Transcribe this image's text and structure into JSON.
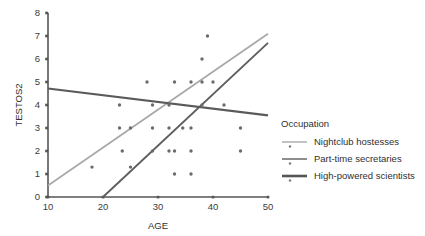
{
  "chart_data": {
    "type": "scatter",
    "title": "",
    "xlabel": "AGE",
    "ylabel": "TESTOS2",
    "xlim": [
      10,
      50
    ],
    "ylim": [
      0,
      8
    ],
    "xticks": [
      10,
      20,
      30,
      40,
      50
    ],
    "yticks": [
      0,
      1,
      2,
      3,
      4,
      5,
      6,
      7,
      8
    ],
    "grid": false,
    "legend_position": "right",
    "legend_title": "Occupation",
    "series": [
      {
        "name": "Nightclub hostesses",
        "color": "#a8a8a8",
        "marker": "dot",
        "trendline": {
          "x": [
            10,
            50
          ],
          "y": [
            0.5,
            7.1
          ]
        },
        "points": [
          {
            "x": 18,
            "y": 1.3
          },
          {
            "x": 23,
            "y": 3
          },
          {
            "x": 23,
            "y": 4
          },
          {
            "x": 25,
            "y": 2
          },
          {
            "x": 25,
            "y": 1.3
          },
          {
            "x": 28,
            "y": 5
          },
          {
            "x": 29,
            "y": 3
          },
          {
            "x": 32,
            "y": 3
          },
          {
            "x": 33,
            "y": 5
          },
          {
            "x": 36,
            "y": 5
          },
          {
            "x": 38,
            "y": 5
          },
          {
            "x": 39,
            "y": 7
          },
          {
            "x": 40,
            "y": 5
          }
        ]
      },
      {
        "name": "Part-time secretaries",
        "color": "#8e8e8e",
        "marker": "dot",
        "trendline": {
          "x": [
            10,
            50
          ],
          "y": [
            0.5,
            6.7
          ]
        },
        "points": [
          {
            "x": 29,
            "y": 2
          },
          {
            "x": 29,
            "y": 4
          },
          {
            "x": 32,
            "y": 2
          },
          {
            "x": 33,
            "y": 2
          },
          {
            "x": 33,
            "y": 1
          },
          {
            "x": 36,
            "y": 2
          },
          {
            "x": 36,
            "y": 3
          },
          {
            "x": 36,
            "y": 1
          },
          {
            "x": 38,
            "y": 5
          },
          {
            "x": 38,
            "y": 6
          }
        ]
      },
      {
        "name": "High-powered scientists",
        "color": "#5a5a5a",
        "marker": "dot",
        "trendline": {
          "x": [
            10,
            50
          ],
          "y": [
            4.72,
            3.55
          ]
        },
        "points": [
          {
            "x": 32,
            "y": 3
          },
          {
            "x": 42,
            "y": 4
          },
          {
            "x": 45,
            "y": 3
          },
          {
            "x": 45,
            "y": 2
          }
        ]
      }
    ],
    "steep_line": {
      "x": [
        20,
        50
      ],
      "y": [
        0,
        6.7
      ],
      "color": "#5e5e5e"
    },
    "all_points": [
      {
        "x": 18,
        "y": 1.3
      },
      {
        "x": 23,
        "y": 3
      },
      {
        "x": 23,
        "y": 4
      },
      {
        "x": 25,
        "y": 3
      },
      {
        "x": 25,
        "y": 1.3
      },
      {
        "x": 23.5,
        "y": 2
      },
      {
        "x": 28,
        "y": 5
      },
      {
        "x": 29,
        "y": 4
      },
      {
        "x": 29,
        "y": 3
      },
      {
        "x": 29,
        "y": 2
      },
      {
        "x": 32,
        "y": 3
      },
      {
        "x": 32,
        "y": 2
      },
      {
        "x": 32,
        "y": 4
      },
      {
        "x": 33,
        "y": 5
      },
      {
        "x": 33,
        "y": 2
      },
      {
        "x": 33,
        "y": 1
      },
      {
        "x": 34.5,
        "y": 3
      },
      {
        "x": 36,
        "y": 5
      },
      {
        "x": 36,
        "y": 3
      },
      {
        "x": 36,
        "y": 2
      },
      {
        "x": 36,
        "y": 1
      },
      {
        "x": 38,
        "y": 5
      },
      {
        "x": 38,
        "y": 6
      },
      {
        "x": 38,
        "y": 4
      },
      {
        "x": 39,
        "y": 7
      },
      {
        "x": 40,
        "y": 5
      },
      {
        "x": 42,
        "y": 4
      },
      {
        "x": 45,
        "y": 3
      },
      {
        "x": 45,
        "y": 2
      }
    ]
  },
  "axis": {
    "x_title": "AGE",
    "y_title": "TESTOS2",
    "x_ticks": [
      "10",
      "20",
      "30",
      "40",
      "50"
    ],
    "y_ticks": [
      "0",
      "1",
      "2",
      "3",
      "4",
      "5",
      "6",
      "7",
      "8"
    ]
  },
  "legend": {
    "title": "Occupation",
    "entries": [
      {
        "label": "Nightclub hostesses",
        "color": "#a8a8a8"
      },
      {
        "label": "Part-time secretaries",
        "color": "#8e8e8e"
      },
      {
        "label": "High-powered scientists",
        "color": "#555555"
      }
    ]
  },
  "colors": {
    "axis": "#555555",
    "point": "#6b6b6b",
    "background": "#ffffff"
  }
}
